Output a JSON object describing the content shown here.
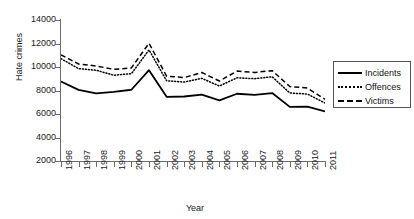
{
  "chart_data": {
    "type": "line",
    "title": "",
    "xlabel": "Year",
    "ylabel": "Hate crimes",
    "x": [
      1996,
      1997,
      1998,
      1999,
      2000,
      2001,
      2002,
      2003,
      2004,
      2005,
      2006,
      2007,
      2008,
      2009,
      2010,
      2011
    ],
    "xtick_labels": [
      "1996",
      "1997",
      "1998",
      "1999",
      "2000",
      "2001",
      "2002",
      "2003",
      "2004",
      "2005",
      "2006",
      "2007",
      "2008",
      "2009",
      "2010",
      "2011"
    ],
    "ytick_labels": [
      "14000",
      "12000",
      "10000",
      "8000",
      "6000",
      "4000",
      "2000"
    ],
    "ytick_values": [
      14000,
      12000,
      10000,
      8000,
      6000,
      4000,
      2000
    ],
    "ylim": [
      2000,
      14000
    ],
    "xlim": [
      1996,
      2011
    ],
    "grid": false,
    "legend_position": "right",
    "series": [
      {
        "name": "Incidents",
        "style": "solid",
        "color": "#000000",
        "values": [
          8759,
          8049,
          7755,
          7876,
          8063,
          9730,
          7462,
          7489,
          7649,
          7163,
          7722,
          7624,
          7783,
          6604,
          6628,
          6222
        ]
      },
      {
        "name": "Offences",
        "style": "dotted",
        "color": "#000000",
        "values": [
          10706,
          9861,
          9722,
          9301,
          9430,
          11451,
          8832,
          8715,
          9035,
          8380,
          9080,
          9006,
          9168,
          7789,
          7699,
          6933
        ]
      },
      {
        "name": "Victims",
        "style": "dashed",
        "color": "#000000",
        "values": [
          11039,
          10255,
          10086,
          9802,
          9924,
          12020,
          9222,
          9100,
          9528,
          8804,
          9652,
          9535,
          9691,
          8336,
          8208,
          7254
        ]
      }
    ]
  },
  "legend": {
    "items": [
      {
        "label": "Incidents",
        "style": "solid"
      },
      {
        "label": "Offences",
        "style": "dotted"
      },
      {
        "label": "Victims",
        "style": "dashed"
      }
    ]
  }
}
